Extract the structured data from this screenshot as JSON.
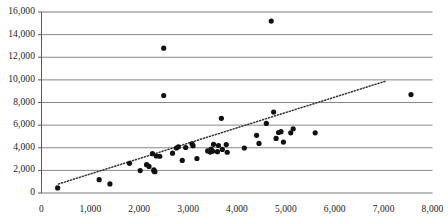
{
  "chart_data": {
    "type": "scatter",
    "title": "",
    "xlabel": "",
    "ylabel": "",
    "xlim": [
      0,
      8000
    ],
    "ylim": [
      0,
      16000
    ],
    "grid": true,
    "grid_axis": "y",
    "legend": "none",
    "x_ticks": [
      0,
      1000,
      2000,
      3000,
      4000,
      5000,
      6000,
      7000,
      8000
    ],
    "x_tick_labels": [
      "0",
      "1,000",
      "2,000",
      "3,000",
      "4,000",
      "5,000",
      "6,000",
      "7,000",
      "8,000"
    ],
    "y_ticks": [
      0,
      2000,
      4000,
      6000,
      8000,
      10000,
      12000,
      14000,
      16000
    ],
    "y_tick_labels": [
      "0",
      "2,000",
      "4,000",
      "6,000",
      "8,000",
      "10,000",
      "12,000",
      "14,000",
      "16,000"
    ],
    "marker": {
      "shape": "circle",
      "color": "#111111",
      "size_px": 5.2
    },
    "series": [
      {
        "name": "observations",
        "points": [
          [
            330,
            450
          ],
          [
            1180,
            1180
          ],
          [
            1400,
            800
          ],
          [
            1800,
            2620
          ],
          [
            2020,
            1980
          ],
          [
            2150,
            2500
          ],
          [
            2200,
            2350
          ],
          [
            2270,
            3480
          ],
          [
            2300,
            2050
          ],
          [
            2300,
            1950
          ],
          [
            2320,
            1880
          ],
          [
            2350,
            3270
          ],
          [
            2420,
            3250
          ],
          [
            2500,
            12800
          ],
          [
            2500,
            8620
          ],
          [
            2680,
            3520
          ],
          [
            2760,
            3980
          ],
          [
            2800,
            4080
          ],
          [
            2880,
            2880
          ],
          [
            2950,
            4020
          ],
          [
            3080,
            4350
          ],
          [
            3100,
            4180
          ],
          [
            3180,
            3050
          ],
          [
            3400,
            3720
          ],
          [
            3450,
            3620
          ],
          [
            3470,
            3880
          ],
          [
            3500,
            3700
          ],
          [
            3520,
            4300
          ],
          [
            3600,
            3650
          ],
          [
            3620,
            4200
          ],
          [
            3680,
            6600
          ],
          [
            3700,
            3850
          ],
          [
            3780,
            4280
          ],
          [
            3800,
            3600
          ],
          [
            4150,
            3980
          ],
          [
            4400,
            5100
          ],
          [
            4450,
            4380
          ],
          [
            4600,
            6150
          ],
          [
            4700,
            15200
          ],
          [
            4750,
            7150
          ],
          [
            4800,
            4820
          ],
          [
            4850,
            5350
          ],
          [
            4900,
            5420
          ],
          [
            4950,
            4500
          ],
          [
            5100,
            5320
          ],
          [
            5150,
            5680
          ],
          [
            5600,
            5320
          ],
          [
            7560,
            8700
          ]
        ]
      }
    ],
    "trendline": {
      "type": "linear",
      "style": "dotted",
      "color": "#333333",
      "x_start": 350,
      "y_start": 800,
      "x_end": 7050,
      "y_end": 9900
    }
  }
}
